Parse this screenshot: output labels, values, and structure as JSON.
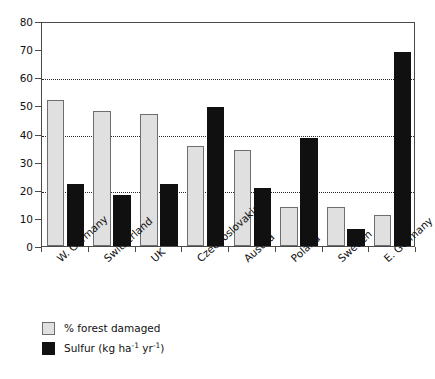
{
  "chart_data": {
    "type": "bar",
    "title": "",
    "subtitle": "",
    "xlabel": "",
    "ylabel": "",
    "ylim": [
      0,
      80
    ],
    "yticks": [
      0,
      10,
      20,
      30,
      40,
      50,
      60,
      70,
      80
    ],
    "gridlines_at": [
      20,
      40,
      60
    ],
    "grid": true,
    "legend_position": "bottom-left",
    "categories": [
      "W. Germany",
      "Switzerland",
      "UK",
      "Czechoslovakia",
      "Austria",
      "Poland",
      "Sweden",
      "E. Germany"
    ],
    "series": [
      {
        "name": "% forest damaged",
        "color": "#e0e0e0",
        "values": [
          52,
          48,
          47,
          35.5,
          34,
          14,
          14,
          11
        ]
      },
      {
        "name": "Sulfur (kg ha-1 yr-1)",
        "color": "#101010",
        "values": [
          22,
          18,
          22,
          49.5,
          20.5,
          38.5,
          6,
          69
        ]
      }
    ]
  },
  "legend": {
    "items": [
      {
        "label": "% forest damaged",
        "swatch": "light"
      },
      {
        "label_prefix": "Sulfur (kg ha",
        "sup1": "-1",
        "label_mid": " yr",
        "sup2": "-1",
        "label_suffix": ")",
        "swatch": "dark"
      }
    ]
  },
  "axis": {
    "y_tick_labels": [
      "80",
      "70",
      "60",
      "50",
      "40",
      "30",
      "20",
      "10",
      "0"
    ]
  }
}
